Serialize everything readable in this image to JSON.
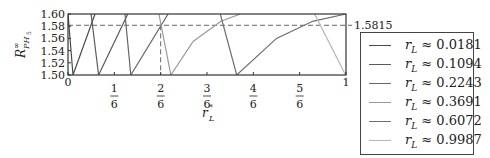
{
  "chart_data": {
    "type": "line",
    "title": "",
    "xlabel": "r*_L",
    "ylabel": "R^∞_{PH_5}",
    "xlim": [
      0,
      1
    ],
    "ylim": [
      1.5,
      1.6
    ],
    "x_ticks": [
      "0",
      "1/6",
      "2/6",
      "3/6",
      "4/6",
      "5/6",
      "1"
    ],
    "y_ticks": [
      "1.50",
      "1.52",
      "1.54",
      "1.56",
      "1.58",
      "1.60"
    ],
    "reference_line": {
      "y": 1.5815,
      "label": "1.5815",
      "style": "dashed"
    },
    "reference_vline": {
      "x": 0.3333,
      "style": "dashed",
      "from_y": 1.5,
      "to_y": 1.5815
    },
    "grid": false,
    "legend_position": "right-outside",
    "series": [
      {
        "name": "r_L ≈ 0.0181",
        "color": "#4a4a4a",
        "points": [
          [
            0.0,
            1.6
          ],
          [
            0.018,
            1.5
          ],
          [
            0.097,
            1.6
          ]
        ]
      },
      {
        "name": "r_L ≈ 0.1094",
        "color": "#5a5a5a",
        "points": [
          [
            0.083,
            1.6
          ],
          [
            0.11,
            1.5
          ],
          [
            0.215,
            1.6
          ]
        ]
      },
      {
        "name": "r_L ≈ 0.2243",
        "color": "#666666",
        "points": [
          [
            0.205,
            1.6
          ],
          [
            0.226,
            1.5
          ],
          [
            0.36,
            1.6
          ]
        ]
      },
      {
        "name": "r_L ≈ 0.3691",
        "color": "#9a9a9a",
        "points": [
          [
            0.327,
            1.6
          ],
          [
            0.37,
            1.5
          ],
          [
            0.45,
            1.555
          ],
          [
            0.55,
            1.588
          ],
          [
            0.62,
            1.6
          ]
        ]
      },
      {
        "name": "r_L ≈ 0.6072",
        "color": "#6e6e6e",
        "points": [
          [
            0.548,
            1.6
          ],
          [
            0.607,
            1.5
          ],
          [
            0.75,
            1.56
          ],
          [
            0.88,
            1.588
          ],
          [
            1.0,
            1.6
          ]
        ]
      },
      {
        "name": "r_L ≈ 0.9987",
        "color": "#b5b5b5",
        "points": [
          [
            0.887,
            1.6
          ],
          [
            0.9987,
            1.5
          ]
        ]
      }
    ]
  },
  "axes": {
    "y_label": "R",
    "y_label_sup": "∞",
    "y_label_sub": "PH",
    "y_label_sub2": "5",
    "x_label": "r",
    "x_label_sup": "*",
    "x_label_sub": "L",
    "ref_label": "1.5815"
  },
  "legend": {
    "items": [
      {
        "symbol": "r",
        "sub": "L",
        "text": " ≈ 0.0181",
        "color": "#4a4a4a"
      },
      {
        "symbol": "r",
        "sub": "L",
        "text": " ≈ 0.1094",
        "color": "#5a5a5a"
      },
      {
        "symbol": "r",
        "sub": "L",
        "text": " ≈ 0.2243",
        "color": "#666666"
      },
      {
        "symbol": "r",
        "sub": "L",
        "text": " ≈ 0.3691",
        "color": "#9a9a9a"
      },
      {
        "symbol": "r",
        "sub": "L",
        "text": " ≈ 0.6072",
        "color": "#6e6e6e"
      },
      {
        "symbol": "r",
        "sub": "L",
        "text": " ≈ 0.9987",
        "color": "#b5b5b5"
      }
    ]
  }
}
